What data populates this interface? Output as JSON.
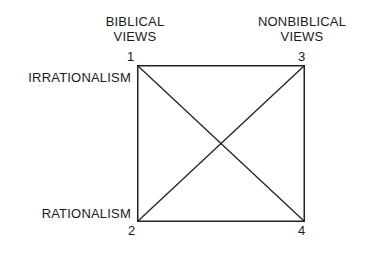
{
  "figure": {
    "type": "square-with-diagonals",
    "stroke_color": "#222222",
    "background_color": "#ffffff",
    "column_headings": [
      {
        "id": "biblical",
        "line1": "BIBLICAL",
        "line2": "VIEWS",
        "position": "top-left"
      },
      {
        "id": "nonbiblical",
        "line1": "NONBIBLICAL",
        "line2": "VIEWS",
        "position": "top-right"
      }
    ],
    "row_headings": [
      {
        "id": "irrationalism",
        "label": "IRRATIONALISM",
        "position": "left-top"
      },
      {
        "id": "rationalism",
        "label": "RATIONALISM",
        "position": "left-bottom"
      }
    ],
    "corners": [
      {
        "number": "1",
        "position": "top-left",
        "column": "BIBLICAL VIEWS",
        "row": "IRRATIONALISM"
      },
      {
        "number": "2",
        "position": "bottom-left",
        "column": "BIBLICAL VIEWS",
        "row": "RATIONALISM"
      },
      {
        "number": "3",
        "position": "top-right",
        "column": "NONBIBLICAL VIEWS",
        "row": "IRRATIONALISM"
      },
      {
        "number": "4",
        "position": "bottom-right",
        "column": "NONBIBLICAL VIEWS",
        "row": "RATIONALISM"
      }
    ],
    "edges": [
      {
        "from": "1",
        "to": "3",
        "kind": "side-top"
      },
      {
        "from": "1",
        "to": "2",
        "kind": "side-left"
      },
      {
        "from": "3",
        "to": "4",
        "kind": "side-right"
      },
      {
        "from": "2",
        "to": "4",
        "kind": "side-bottom"
      },
      {
        "from": "1",
        "to": "4",
        "kind": "diagonal"
      },
      {
        "from": "2",
        "to": "3",
        "kind": "diagonal"
      }
    ]
  }
}
